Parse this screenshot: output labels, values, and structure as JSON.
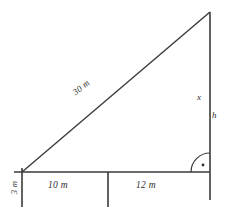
{
  "diagram": {
    "type": "right-triangle-geometry",
    "background_color": "#ffffff",
    "stroke_color": "#3a3a3a",
    "labels": {
      "hypotenuse": "30 m",
      "base_left_segment": "10 m",
      "base_right_segment": "12 m",
      "vertical_left_segment": "3 m",
      "upper_vertical": "x",
      "full_vertical": "h"
    },
    "markers": {
      "right_angle": "right-angle-arc-with-dot"
    },
    "geometry": {
      "apex": [
        210,
        12
      ],
      "left_vertex": [
        22,
        172
      ],
      "right_vertex": [
        210,
        172
      ],
      "mid_tick_x": 108,
      "baseline_y": 172,
      "left_vertical_bottom": [
        22,
        207
      ],
      "right_vertical_bottom": [
        210,
        200
      ],
      "mid_tick_bottom": [
        108,
        207
      ]
    }
  }
}
